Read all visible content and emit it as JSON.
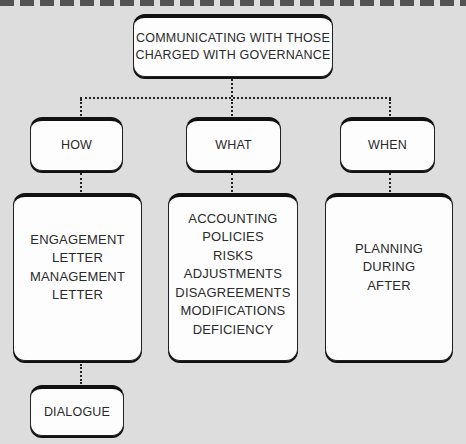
{
  "diagram": {
    "title_node": {
      "lines": [
        "COMMUNICATING WITH THOSE",
        "CHARGED WITH GOVERNANCE"
      ]
    },
    "categories": [
      {
        "label": "HOW",
        "details": [
          "ENGAGEMENT",
          "LETTER",
          "MANAGEMENT",
          "LETTER"
        ],
        "sub_node": "DIALOGUE"
      },
      {
        "label": "WHAT",
        "details": [
          "ACCOUNTING",
          "POLICIES",
          "RISKS",
          "ADJUSTMENTS",
          "DISAGREEMENTS",
          "MODIFICATIONS",
          "DEFICIENCY"
        ]
      },
      {
        "label": "WHEN",
        "details": [
          "PLANNING",
          "DURING",
          "AFTER"
        ]
      }
    ]
  },
  "colors": {
    "background": "#dddddd",
    "box_fill": "#fdfdfd",
    "border": "#111111",
    "text": "#2a2a2a"
  }
}
